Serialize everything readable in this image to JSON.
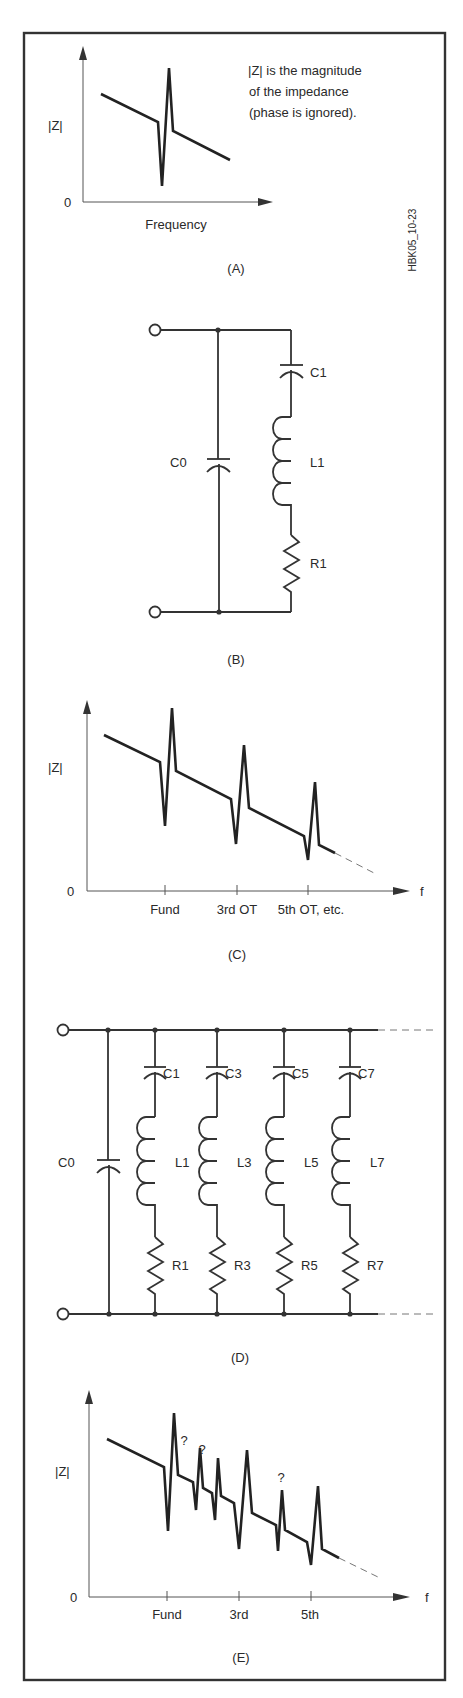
{
  "figure_id": "HBK05_10-23",
  "panel_a": {
    "caption": "(A)",
    "y_label": "|Z|",
    "origin_label": "0",
    "x_label": "Frequency",
    "note_lines": [
      "|Z| is the magnitude",
      "of the impedance",
      "(phase is ignored)."
    ]
  },
  "panel_b": {
    "caption": "(B)",
    "components": {
      "c0": "C0",
      "c1": "C1",
      "l1": "L1",
      "r1": "R1"
    }
  },
  "panel_c": {
    "caption": "(C)",
    "y_label": "|Z|",
    "origin_label": "0",
    "x_axis_label": "f",
    "ticks": [
      "Fund",
      "3rd OT",
      "5th OT, etc."
    ]
  },
  "panel_d": {
    "caption": "(D)",
    "c0": "C0",
    "branches": [
      {
        "c": "C1",
        "l": "L1",
        "r": "R1"
      },
      {
        "c": "C3",
        "l": "L3",
        "r": "R3"
      },
      {
        "c": "C5",
        "l": "L5",
        "r": "R5"
      },
      {
        "c": "C7",
        "l": "L7",
        "r": "R7"
      }
    ]
  },
  "panel_e": {
    "caption": "(E)",
    "y_label": "|Z|",
    "origin_label": "0",
    "x_axis_label": "f",
    "ticks": [
      "Fund",
      "3rd",
      "5th"
    ],
    "unknown_marks": [
      "?",
      "?",
      "?"
    ]
  }
}
